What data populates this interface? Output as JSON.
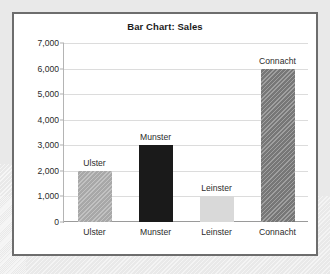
{
  "chart_data": {
    "type": "bar",
    "title": "Bar Chart: Sales",
    "xlabel": "",
    "ylabel": "",
    "categories": [
      "Ulster",
      "Munster",
      "Leinster",
      "Connacht"
    ],
    "values": [
      2000,
      3000,
      1000,
      6000
    ],
    "data_labels": [
      "Ulster",
      "Munster",
      "Leinster",
      "Connacht"
    ],
    "ylim": [
      0,
      7000
    ],
    "ytick_values": [
      0,
      1000,
      2000,
      3000,
      4000,
      5000,
      6000,
      7000
    ],
    "ytick_labels": [
      "0",
      "1,000",
      "2,000",
      "3,000",
      "4,000",
      "5,000",
      "6,000",
      "7,000"
    ],
    "grid": "horizontal",
    "legend": "none",
    "bar_colors": [
      "#a8a8a8",
      "#1a1a1a",
      "#d9d9d9",
      "#777777"
    ],
    "bar_patterns": [
      "hatch",
      "solid",
      "solid",
      "hatch"
    ]
  },
  "style": {
    "page_background": "#e9e9e9",
    "panel_background": "#ffffff",
    "panel_border": "#6d6d6d",
    "gridline_color": "#dcdcdc",
    "axis_color": "#9a9a9a",
    "text_color": "#2a2a2a",
    "title_color": "#1b1b1b"
  }
}
